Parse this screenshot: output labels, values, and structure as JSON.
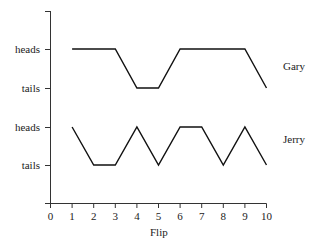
{
  "chart_data": {
    "type": "line",
    "title": "",
    "xlabel": "Flip",
    "ylabel": "",
    "x": [
      1,
      2,
      3,
      4,
      5,
      6,
      7,
      8,
      9,
      10
    ],
    "xticks": [
      "0",
      "1",
      "2",
      "3",
      "4",
      "5",
      "6",
      "7",
      "8",
      "9",
      "10"
    ],
    "xlim": [
      0,
      10
    ],
    "ytick_labels": [
      "heads",
      "tails",
      "heads",
      "tails"
    ],
    "grid": false,
    "legend_position": "right of each series",
    "series": [
      {
        "name": "Gary",
        "values": [
          "heads",
          "heads",
          "heads",
          "tails",
          "tails",
          "heads",
          "heads",
          "heads",
          "heads",
          "tails"
        ]
      },
      {
        "name": "Jerry",
        "values": [
          "heads",
          "tails",
          "tails",
          "heads",
          "tails",
          "heads",
          "heads",
          "tails",
          "heads",
          "tails"
        ]
      }
    ]
  },
  "labels": {
    "gary": "Gary",
    "jerry": "Jerry",
    "xlabel": "Flip",
    "gary_heads": "heads",
    "gary_tails": "tails",
    "jerry_heads": "heads",
    "jerry_tails": "tails"
  }
}
